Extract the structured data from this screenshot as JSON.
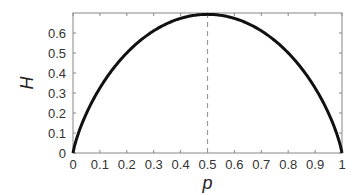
{
  "chart_data": {
    "type": "line",
    "title": "",
    "xlabel": "p",
    "ylabel": "H",
    "xlim": [
      0,
      1
    ],
    "ylim": [
      0,
      0.7
    ],
    "xticks": [
      0,
      0.1,
      0.2,
      0.3,
      0.4,
      0.5,
      0.6,
      0.7,
      0.8,
      0.9,
      1
    ],
    "xtick_labels": [
      "0",
      "0.1",
      "0.2",
      "0.3",
      "0.4",
      "0.5",
      "0.6",
      "0.7",
      "0.8",
      "0.9",
      "1"
    ],
    "yticks": [
      0,
      0.1,
      0.2,
      0.3,
      0.4,
      0.5,
      0.6
    ],
    "ytick_labels": [
      "0",
      "0.1",
      "0.2",
      "0.3",
      "0.4",
      "0.5",
      "0.6"
    ],
    "grid": false,
    "legend": null,
    "series": [
      {
        "name": "H(p) = -p ln p - (1-p) ln(1-p)",
        "x": [
          0,
          0.05,
          0.1,
          0.15,
          0.2,
          0.25,
          0.3,
          0.35,
          0.4,
          0.45,
          0.5,
          0.55,
          0.6,
          0.65,
          0.7,
          0.75,
          0.8,
          0.85,
          0.9,
          0.95,
          1
        ],
        "y": [
          0,
          0.199,
          0.325,
          0.423,
          0.5,
          0.562,
          0.611,
          0.647,
          0.673,
          0.688,
          0.693,
          0.688,
          0.673,
          0.647,
          0.611,
          0.562,
          0.5,
          0.423,
          0.325,
          0.199,
          0
        ],
        "color": "#111111",
        "linewidth": 3
      }
    ],
    "annotations": [
      {
        "type": "vline",
        "x": 0.5,
        "style": "dashed",
        "color": "#999999"
      }
    ]
  },
  "colors": {
    "curve": "#111111",
    "axes": "#888888",
    "dashed": "#999999"
  }
}
